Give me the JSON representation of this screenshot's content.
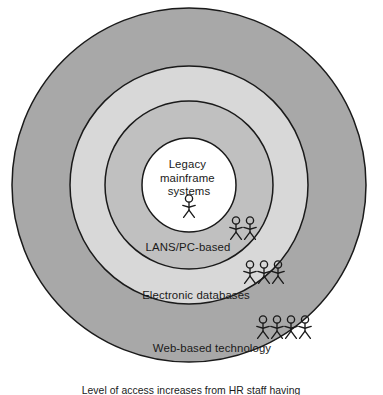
{
  "diagram": {
    "type": "concentric-rings",
    "title_visible": false,
    "background_color": "#ffffff",
    "outline_color": "#1a1a1a",
    "center": {
      "x": 189,
      "y": 185
    },
    "layers": [
      {
        "id": "web-based-technology",
        "label": "Web-based technology",
        "level": 4,
        "radius": 177,
        "fill_color": "#a8a8a8",
        "figure_count": 4,
        "label_position": {
          "x": 212,
          "y": 348
        },
        "figures_position": {
          "x": 284,
          "y": 327
        }
      },
      {
        "id": "electronic-databases",
        "label": "Electronic databases",
        "level": 3,
        "radius": 119,
        "fill_color": "#d8d8d8",
        "figure_count": 3,
        "label_position": {
          "x": 196,
          "y": 295
        },
        "figures_position": {
          "x": 264,
          "y": 272
        }
      },
      {
        "id": "lans-pc-based",
        "label": "LANS/PC-based",
        "level": 2,
        "radius": 84,
        "fill_color": "#c0c0c0",
        "figure_count": 2,
        "label_position": {
          "x": 188,
          "y": 247
        },
        "figures_position": {
          "x": 243,
          "y": 228
        }
      },
      {
        "id": "legacy-mainframe-systems",
        "label": "Legacy mainframe systems",
        "label_lines": [
          "Legacy",
          "mainframe",
          "systems"
        ],
        "level": 1,
        "radius": 47,
        "fill_color": "#ffffff",
        "figure_count": 1,
        "label_position": {
          "x": 189,
          "y": 168
        },
        "figures_position": {
          "x": 189,
          "y": 206
        }
      }
    ]
  },
  "caption": {
    "text": "Level of access increases from HR staff having",
    "clipped": true,
    "position": {
      "x": 191,
      "y": 393
    }
  },
  "icons": {
    "person_figure": "stick-figure-person-icon"
  }
}
